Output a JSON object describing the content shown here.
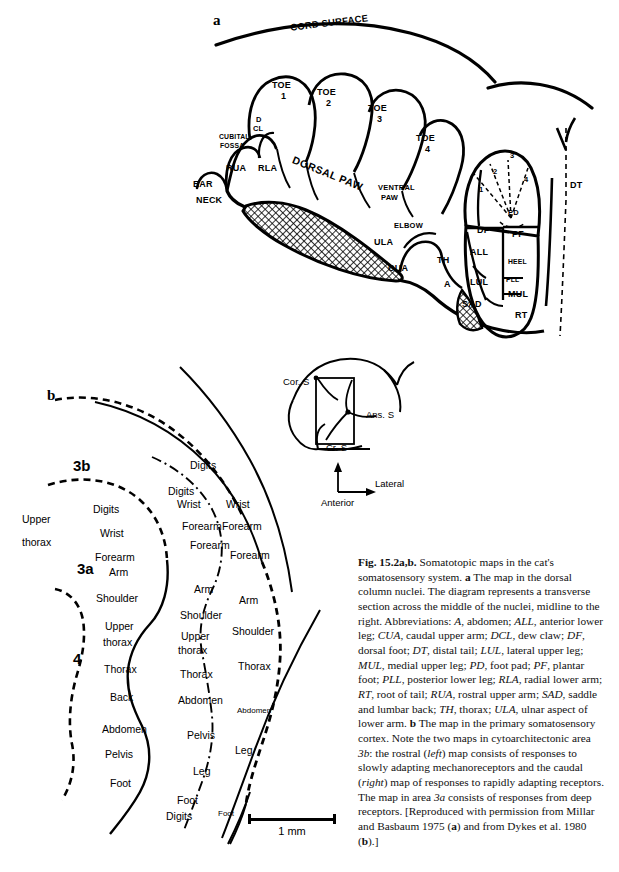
{
  "figure": {
    "panel_a_letter": "a",
    "panel_b_letter": "b"
  },
  "panel_a": {
    "title_label": "CORD SURFACE",
    "regions": [
      {
        "id": "toe1",
        "label": "TOE\n1",
        "text1": "TOE",
        "text2": "1"
      },
      {
        "id": "toe2",
        "label": "TOE 2",
        "text1": "TOE",
        "text2": "2"
      },
      {
        "id": "toe3",
        "label": "TOE 3",
        "text1": "TOE",
        "text2": "3"
      },
      {
        "id": "toe4",
        "label": "TOE 4",
        "text1": "TOE",
        "text2": "4"
      }
    ],
    "labels": {
      "cord_surface": "CORD SURFACE",
      "toe": "TOE",
      "toe1_num": "1",
      "toe2_num": "2",
      "toe3_num": "3",
      "toe4_num": "4",
      "d": "D",
      "cl": "CL",
      "cubital": "CUBITAL",
      "fossa": "FOSSA",
      "rua": "RUA",
      "rla": "RLA",
      "ear": "EAR",
      "neck": "NECK",
      "dorsal_paw": "DORSAL PAW",
      "ventral": "VENTRAL",
      "paw": "PAW",
      "elbow": "ELBOW",
      "ula": "ULA",
      "cua": "CUA",
      "th": "TH",
      "a": "A",
      "sad": "SAD",
      "df": "DF",
      "all": "ALL",
      "lul": "LUL",
      "pd": "PD",
      "pf": "PF",
      "heel": "HEEL",
      "pll": "PLL",
      "mul": "MUL",
      "rt": "RT",
      "dt": "DT",
      "digit1": "1",
      "digit2": "2",
      "digit3": "3",
      "digit4": "4"
    }
  },
  "panel_b": {
    "areas": {
      "area_3b": "3b",
      "area_3a": "3a",
      "area_4": "4"
    },
    "column_left_outer": [
      "Upper",
      "thorax"
    ],
    "labels_col_3a": [
      "Digits",
      "Wrist",
      "Forearm",
      "Arm",
      "Shoulder",
      "Upper",
      "thorax",
      "Thorax",
      "Back",
      "Abdomen",
      "Pelvis",
      "Foot"
    ],
    "labels_col_3b_rostral": [
      "Digits",
      "Wrist",
      "Forearm",
      "Forearm",
      "Arm",
      "Shoulder",
      "Upper",
      "thorax",
      "Thorax",
      "Abdomen",
      "Pelvis",
      "Leg",
      "Foot",
      "Digits"
    ],
    "labels_col_3b_caudal": [
      "Digits",
      "Wrist",
      "Forearm",
      "Forearm",
      "Arm",
      "Shoulder",
      "Thorax",
      "Abdomen",
      "Leg",
      "Foot"
    ],
    "flat_labels": [
      "Digits",
      "Digits",
      "Digits",
      "Wrist",
      "Wrist",
      "Wrist",
      "Forearm",
      "Forearm",
      "Forearm",
      "Forearm",
      "Forearm",
      "Arm",
      "Arm",
      "Arm",
      "Shoulder",
      "Shoulder",
      "Shoulder",
      "Upper",
      "thorax",
      "Upper",
      "thorax",
      "Upper",
      "thorax",
      "Thorax",
      "Thorax",
      "Thorax",
      "Back",
      "Abdomen",
      "Abdomen",
      "Abdomen",
      "Pelvis",
      "Pelvis",
      "Leg",
      "Leg",
      "Foot",
      "Foot",
      "Foot",
      "Digits"
    ],
    "scale_bar": "1 mm",
    "inset": {
      "cor_s": "Cor. S",
      "ans_s": "Ans. S",
      "cr_s": "Cr. S"
    },
    "compass": {
      "lateral": "Lateral",
      "anterior": "Anterior"
    }
  },
  "caption": {
    "figure_number": "Fig. 15.2a,b.",
    "body_1": " Somatotopic maps in the cat's somatosensory system. ",
    "a_marker": "a",
    "body_2": " The map in the dorsal column nuclei. The diagram represents a transverse section across the middle of the nuclei, midline to the right. Abbreviations: ",
    "abbrev_text": "A, abdomen; ALL, anterior lower leg; CUA, caudal upper arm; DCL, dew claw; DF, dorsal foot; DT, distal tail; LUL, lateral upper leg; MUL, medial upper leg; PD, foot pad; PF, plantar foot; PLL, posterior lower leg; RLA, radial lower arm; RT, root of tail; RUA, rostral upper arm; SAD, saddle and lumbar back; TH, thorax; ULA, ulnar aspect of lower arm. ",
    "b_marker": "b",
    "body_3": " The map in the primary somatosensory cortex. Note the two maps in cytoarchitectonic area ",
    "area_3b_italic": "3b",
    "body_4": ": the rostral (",
    "left_italic": "left",
    "body_5": ") map consists of responses to slowly adapting mechanoreceptors and the caudal (",
    "right_italic": "right",
    "body_6": ") map of responses to rapidly adapting receptors. The map in area ",
    "area_3a_italic": "3a",
    "body_7": " consists of responses from deep receptors. [Reproduced with permission from Millar and Basbaum 1975 (",
    "a_marker2": "a",
    "body_8": ") and from Dykes et al. 1980 (",
    "b_marker2": "b",
    "body_9": ").]"
  },
  "colors": {
    "ink": "#000000",
    "paper": "#ffffff",
    "hatch": "#333333"
  }
}
